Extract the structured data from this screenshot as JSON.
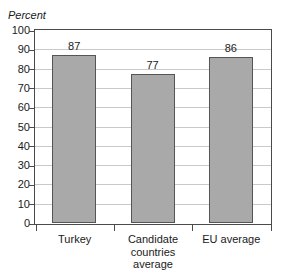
{
  "chart_data": {
    "type": "bar",
    "title": "",
    "subtitle": "",
    "xlabel": "",
    "ylabel": "Percent",
    "ylim": [
      0,
      100
    ],
    "yticks": [
      0,
      10,
      20,
      30,
      40,
      50,
      60,
      70,
      80,
      90,
      100
    ],
    "ytick_labels": [
      "0",
      "10",
      "20",
      "30",
      "40",
      "50",
      "60",
      "70",
      "80",
      "90",
      "100"
    ],
    "grid": true,
    "legend": false,
    "legend_position": "none",
    "categories": [
      "Turkey",
      "Candidate countries average",
      "EU average"
    ],
    "category_lines": [
      [
        "Turkey"
      ],
      [
        "Candidate",
        "countries",
        "average"
      ],
      [
        "EU average"
      ]
    ],
    "values": [
      87,
      77,
      86
    ],
    "value_labels": [
      "87",
      "77",
      "86"
    ],
    "bar_color": "#a9a9a9",
    "bar_edge_color": "#555555",
    "gridline_color": "#c9c9c9",
    "axis_color": "#4a4a4a",
    "background_color": "#ffffff"
  },
  "axis": {
    "y_title": "Percent"
  }
}
